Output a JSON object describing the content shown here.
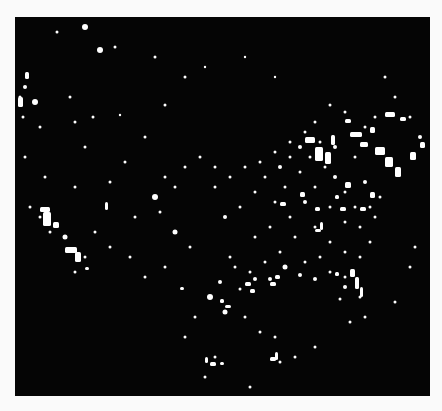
{
  "image": {
    "subject": "US city lights at night (satellite composite)",
    "background": "#050505",
    "page_background": "#fafafa",
    "light_color": "#ffffff",
    "frame": {
      "x": 15,
      "y": 17,
      "width": 415,
      "height": 379
    }
  },
  "lights": {
    "dots": [
      [
        70,
        10,
        3
      ],
      [
        85,
        33,
        3
      ],
      [
        42,
        15,
        1.5
      ],
      [
        100,
        30,
        1.5
      ],
      [
        140,
        40,
        1.5
      ],
      [
        10,
        70,
        2
      ],
      [
        20,
        85,
        3
      ],
      [
        25,
        110,
        1.5
      ],
      [
        55,
        80,
        1.5
      ],
      [
        60,
        105,
        1.5
      ],
      [
        78,
        100,
        1.5
      ],
      [
        105,
        98,
        1.2
      ],
      [
        70,
        130,
        1.5
      ],
      [
        110,
        145,
        1.5
      ],
      [
        30,
        160,
        1.5
      ],
      [
        60,
        170,
        1.5
      ],
      [
        95,
        165,
        1.5
      ],
      [
        130,
        120,
        1.5
      ],
      [
        150,
        88,
        1.5
      ],
      [
        170,
        60,
        1.5
      ],
      [
        190,
        50,
        1.2
      ],
      [
        230,
        40,
        1.2
      ],
      [
        260,
        60,
        1.2
      ],
      [
        120,
        200,
        1.5
      ],
      [
        140,
        180,
        3
      ],
      [
        145,
        195,
        1.5
      ],
      [
        160,
        215,
        2.5
      ],
      [
        175,
        230,
        1.5
      ],
      [
        200,
        170,
        1.5
      ],
      [
        210,
        200,
        2
      ],
      [
        225,
        190,
        1.5
      ],
      [
        240,
        175,
        1.5
      ],
      [
        250,
        160,
        1.5
      ],
      [
        265,
        150,
        2
      ],
      [
        275,
        140,
        1.5
      ],
      [
        285,
        130,
        2
      ],
      [
        260,
        185,
        1.5
      ],
      [
        275,
        200,
        1.5
      ],
      [
        290,
        185,
        2
      ],
      [
        300,
        170,
        1.5
      ],
      [
        310,
        150,
        1.5
      ],
      [
        320,
        160,
        2
      ],
      [
        330,
        175,
        1.5
      ],
      [
        315,
        190,
        1.5
      ],
      [
        300,
        210,
        1.5
      ],
      [
        280,
        220,
        1.5
      ],
      [
        265,
        235,
        1.5
      ],
      [
        250,
        245,
        1.5
      ],
      [
        235,
        255,
        1.5
      ],
      [
        220,
        250,
        1.5
      ],
      [
        205,
        265,
        2
      ],
      [
        195,
        280,
        3
      ],
      [
        215,
        240,
        1.5
      ],
      [
        240,
        220,
        1.5
      ],
      [
        255,
        210,
        1.5
      ],
      [
        270,
        170,
        1.5
      ],
      [
        285,
        155,
        1.5
      ],
      [
        295,
        140,
        1.5
      ],
      [
        305,
        125,
        1.5
      ],
      [
        320,
        130,
        2
      ],
      [
        340,
        140,
        1.5
      ],
      [
        350,
        165,
        2
      ],
      [
        340,
        190,
        1.5
      ],
      [
        330,
        205,
        1.5
      ],
      [
        345,
        210,
        1.5
      ],
      [
        355,
        190,
        1.5
      ],
      [
        365,
        180,
        1.5
      ],
      [
        360,
        200,
        1.5
      ],
      [
        355,
        225,
        1.5
      ],
      [
        345,
        240,
        1.5
      ],
      [
        330,
        235,
        1.5
      ],
      [
        315,
        225,
        1.5
      ],
      [
        305,
        240,
        1.5
      ],
      [
        290,
        245,
        1.5
      ],
      [
        330,
        260,
        1.5
      ],
      [
        315,
        255,
        1.5
      ],
      [
        300,
        262,
        2
      ],
      [
        285,
        258,
        2
      ],
      [
        270,
        250,
        2.5
      ],
      [
        255,
        262,
        2
      ],
      [
        240,
        262,
        2
      ],
      [
        225,
        272,
        1.5
      ],
      [
        210,
        295,
        2.5
      ],
      [
        180,
        300,
        1.5
      ],
      [
        170,
        320,
        1.5
      ],
      [
        200,
        340,
        1.5
      ],
      [
        190,
        360,
        1.5
      ],
      [
        235,
        370,
        1.5
      ],
      [
        265,
        345,
        1.5
      ],
      [
        280,
        340,
        1.5
      ],
      [
        300,
        330,
        1.5
      ],
      [
        335,
        305,
        1.5
      ],
      [
        350,
        300,
        1.5
      ],
      [
        380,
        285,
        1.5
      ],
      [
        395,
        250,
        1.5
      ],
      [
        400,
        230,
        1.5
      ],
      [
        405,
        120,
        2
      ],
      [
        395,
        100,
        1.5
      ],
      [
        380,
        80,
        1.5
      ],
      [
        370,
        60,
        1.5
      ],
      [
        360,
        100,
        1.5
      ],
      [
        350,
        110,
        1.5
      ],
      [
        330,
        95,
        1.5
      ],
      [
        315,
        88,
        1.5
      ],
      [
        300,
        105,
        1.5
      ],
      [
        290,
        115,
        1.5
      ],
      [
        275,
        125,
        1.5
      ],
      [
        260,
        135,
        1.5
      ],
      [
        245,
        145,
        1.5
      ],
      [
        230,
        150,
        1.5
      ],
      [
        215,
        160,
        1.5
      ],
      [
        200,
        150,
        1.5
      ],
      [
        185,
        140,
        1.5
      ],
      [
        170,
        150,
        1.5
      ],
      [
        160,
        170,
        1.5
      ],
      [
        150,
        160,
        1.5
      ],
      [
        330,
        270,
        2
      ],
      [
        325,
        282,
        1.5
      ],
      [
        345,
        280,
        1.5
      ],
      [
        230,
        300,
        1.5
      ],
      [
        245,
        315,
        1.5
      ],
      [
        260,
        320,
        1.5
      ],
      [
        150,
        250,
        1.5
      ],
      [
        130,
        260,
        1.5
      ],
      [
        115,
        240,
        1.5
      ],
      [
        95,
        230,
        1.5
      ],
      [
        80,
        215,
        1.5
      ],
      [
        70,
        240,
        1.5
      ],
      [
        60,
        255,
        1.5
      ],
      [
        50,
        220,
        2.5
      ],
      [
        35,
        215,
        1.5
      ],
      [
        25,
        200,
        1.5
      ],
      [
        15,
        190,
        1.5
      ],
      [
        10,
        140,
        1.5
      ],
      [
        8,
        100,
        1.5
      ],
      [
        5,
        80,
        1.5
      ]
    ],
    "blobs": [
      [
        3,
        80,
        5,
        10
      ],
      [
        10,
        55,
        4,
        7
      ],
      [
        25,
        190,
        10,
        5
      ],
      [
        28,
        195,
        8,
        14
      ],
      [
        38,
        205,
        6,
        6
      ],
      [
        50,
        230,
        12,
        6
      ],
      [
        60,
        235,
        6,
        10
      ],
      [
        90,
        185,
        3,
        8
      ],
      [
        70,
        250,
        4,
        3
      ],
      [
        290,
        120,
        10,
        6
      ],
      [
        300,
        130,
        8,
        14
      ],
      [
        310,
        135,
        6,
        12
      ],
      [
        335,
        115,
        12,
        5
      ],
      [
        345,
        125,
        8,
        5
      ],
      [
        360,
        130,
        10,
        8
      ],
      [
        370,
        140,
        8,
        10
      ],
      [
        380,
        150,
        6,
        10
      ],
      [
        395,
        135,
        6,
        8
      ],
      [
        405,
        125,
        5,
        6
      ],
      [
        355,
        110,
        5,
        6
      ],
      [
        330,
        102,
        6,
        4
      ],
      [
        316,
        118,
        4,
        10
      ],
      [
        370,
        95,
        10,
        5
      ],
      [
        385,
        100,
        6,
        4
      ],
      [
        300,
        212,
        6,
        3
      ],
      [
        305,
        205,
        3,
        8
      ],
      [
        335,
        252,
        5,
        8
      ],
      [
        340,
        260,
        4,
        12
      ],
      [
        345,
        270,
        3,
        10
      ],
      [
        320,
        255,
        4,
        4
      ],
      [
        205,
        282,
        4,
        4
      ],
      [
        210,
        288,
        6,
        3
      ],
      [
        195,
        345,
        6,
        4
      ],
      [
        190,
        340,
        3,
        6
      ],
      [
        205,
        345,
        4,
        3
      ],
      [
        255,
        340,
        6,
        4
      ],
      [
        260,
        335,
        3,
        8
      ],
      [
        230,
        265,
        6,
        4
      ],
      [
        235,
        272,
        5,
        4
      ],
      [
        255,
        265,
        6,
        4
      ],
      [
        260,
        258,
        5,
        4
      ],
      [
        165,
        270,
        4,
        3
      ],
      [
        355,
        175,
        5,
        6
      ],
      [
        345,
        190,
        6,
        4
      ],
      [
        325,
        190,
        6,
        4
      ],
      [
        300,
        190,
        5,
        4
      ],
      [
        285,
        175,
        5,
        5
      ],
      [
        265,
        185,
        6,
        4
      ],
      [
        330,
        165,
        6,
        6
      ],
      [
        320,
        178,
        4,
        4
      ]
    ]
  }
}
